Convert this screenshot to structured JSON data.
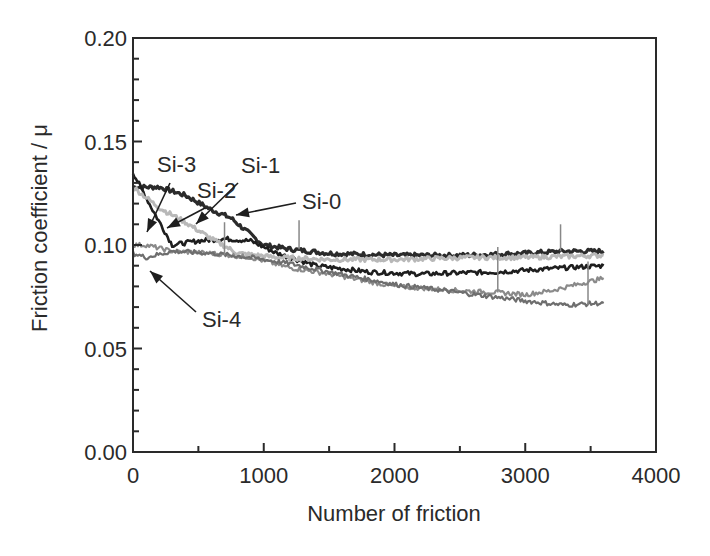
{
  "chart_data": {
    "type": "line",
    "title": "",
    "xlabel": "Number of friction",
    "ylabel": "Friction coefficient / μ",
    "xlim": [
      0,
      4000
    ],
    "ylim": [
      0.0,
      0.2
    ],
    "xticks": [
      0,
      1000,
      2000,
      3000,
      4000
    ],
    "xtick_labels": [
      "0",
      "1000",
      "2000",
      "3000",
      "4000"
    ],
    "x_minor_step": 500,
    "yticks": [
      0.0,
      0.05,
      0.1,
      0.15,
      0.2
    ],
    "ytick_labels": [
      "0.00",
      "0.05",
      "0.10",
      "0.15",
      "0.20"
    ],
    "y_minor_step": 0.01,
    "grid": false,
    "legend": "none (arrow annotations)",
    "series": [
      {
        "name": "Si-0",
        "color": "#2b2b2b",
        "width": 3.2,
        "x": [
          0,
          200,
          400,
          600,
          750,
          900,
          1000,
          1200,
          1500,
          2000,
          2500,
          3000,
          3300,
          3600
        ],
        "values": [
          0.128,
          0.128,
          0.124,
          0.117,
          0.113,
          0.105,
          0.1,
          0.098,
          0.096,
          0.095,
          0.095,
          0.096,
          0.097,
          0.097
        ]
      },
      {
        "name": "Si-1",
        "color": "#1e1e1e",
        "width": 2.6,
        "x": [
          0,
          150,
          300,
          500,
          700,
          900,
          1100,
          1400,
          1800,
          2200,
          2800,
          3300,
          3600
        ],
        "values": [
          0.135,
          0.117,
          0.1,
          0.102,
          0.103,
          0.102,
          0.096,
          0.09,
          0.087,
          0.086,
          0.087,
          0.089,
          0.09
        ]
      },
      {
        "name": "Si-2",
        "color": "#b8b8b8",
        "width": 3,
        "x": [
          0,
          200,
          400,
          600,
          800,
          1100,
          1500,
          2000,
          2600,
          3000,
          3600
        ],
        "values": [
          0.128,
          0.118,
          0.111,
          0.103,
          0.096,
          0.094,
          0.093,
          0.093,
          0.094,
          0.094,
          0.095
        ]
      },
      {
        "name": "Si-3",
        "color": "#8a8a8a",
        "width": 2.2,
        "x": [
          0,
          100,
          300,
          600,
          900,
          1200,
          1500,
          2000,
          2500,
          2800,
          3000,
          3200,
          3400,
          3600
        ],
        "values": [
          0.1,
          0.1,
          0.097,
          0.096,
          0.094,
          0.089,
          0.086,
          0.08,
          0.078,
          0.077,
          0.076,
          0.078,
          0.081,
          0.084
        ]
      },
      {
        "name": "Si-4",
        "color": "#6e6e6e",
        "width": 2.2,
        "x": [
          0,
          100,
          300,
          600,
          900,
          1200,
          1500,
          2000,
          2500,
          3000,
          3300,
          3600
        ],
        "values": [
          0.096,
          0.094,
          0.097,
          0.096,
          0.094,
          0.091,
          0.087,
          0.081,
          0.077,
          0.073,
          0.071,
          0.072
        ]
      }
    ],
    "annotations": [
      {
        "text": "Si-3",
        "text_pos": [
          0.34,
          0.19
        ],
        "arrow_to": [
          40,
          0.1
        ]
      },
      {
        "text": "Si-2",
        "text_pos": [
          0.52,
          0.17
        ],
        "arrow_to": [
          280,
          0.104
        ]
      },
      {
        "text": "Si-1",
        "text_pos": [
          0.62,
          0.16
        ],
        "arrow_to": [
          480,
          0.108
        ]
      },
      {
        "text": "Si-0",
        "text_pos": [
          0.77,
          0.12
        ],
        "arrow_to": [
          830,
          0.115
        ]
      },
      {
        "text": "Si-4",
        "text_pos": [
          0.27,
          0.085
        ],
        "arrow_to": [
          80,
          0.091
        ]
      }
    ]
  }
}
